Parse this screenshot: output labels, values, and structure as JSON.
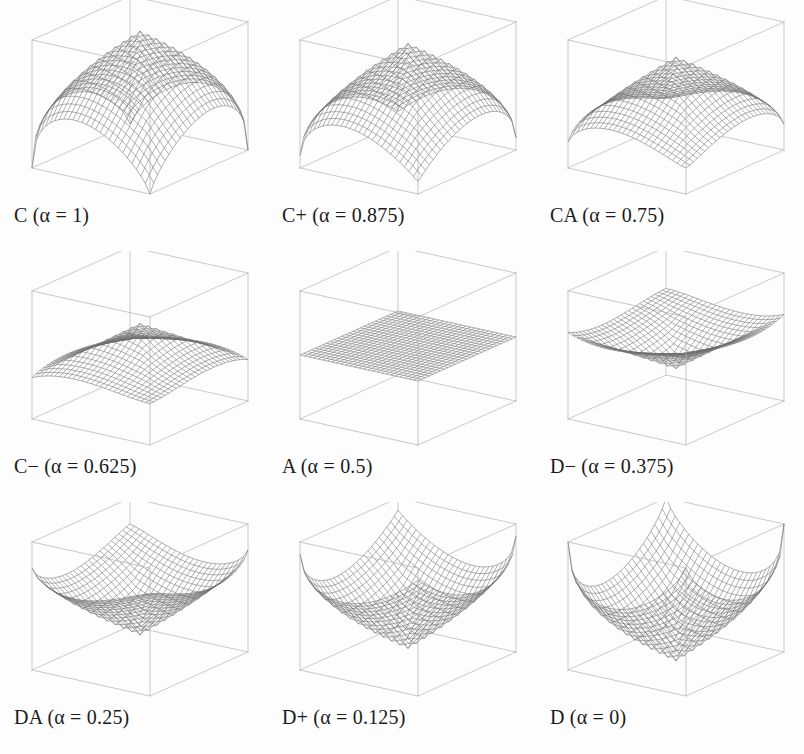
{
  "figure": {
    "title": "",
    "background": "#ffffff",
    "line_color": "#6e6e6e",
    "box_color": "#b0b0b0",
    "rows": 3,
    "cols": 3
  },
  "chart_data": {
    "type": "line",
    "subtype": "3d-wireframe-surface-grid",
    "title": "",
    "xlabel": "",
    "ylabel": "",
    "zlabel": "",
    "grid": false,
    "legend": null,
    "axis_ticks_shown": false,
    "bounding_box": "unit cube wireframe",
    "mesh_resolution": 26,
    "parameter_name": "alpha",
    "panel_layout": [
      [
        "C",
        "C+",
        "CA"
      ],
      [
        "C-",
        "A",
        "D-"
      ],
      [
        "DA",
        "D+",
        "D"
      ]
    ],
    "panels": [
      {
        "id": "C",
        "name": "C",
        "label": "C (α = 1)",
        "alpha": 1,
        "alpha_text": "1",
        "shape": "peak",
        "description": "Conjunction / minimum-like; sharp single peak rising to full height at center-rear, falling to zero along the front edges"
      },
      {
        "id": "C+",
        "name": "C+",
        "label": "C+ (α = 0.875)",
        "alpha": 0.875,
        "alpha_text": "0.875",
        "shape": "peak",
        "description": "Rounded dome, slightly less sharp than C"
      },
      {
        "id": "CA",
        "name": "CA",
        "label": "CA (α = 0.75)",
        "alpha": 0.75,
        "alpha_text": "0.75",
        "shape": "peak",
        "description": "Broad convex dome flattening toward the plane"
      },
      {
        "id": "C-",
        "name": "C−",
        "label": "C− (α = 0.625)",
        "alpha": 0.625,
        "alpha_text": "0.625",
        "shape": "peak",
        "description": "Slightly convex surface approaching the flat plane"
      },
      {
        "id": "A",
        "name": "A",
        "label": "A (α = 0.5)",
        "alpha": 0.5,
        "alpha_text": "0.5",
        "shape": "plane",
        "description": "Arithmetic mean; perfectly flat plane at mid-height"
      },
      {
        "id": "D-",
        "name": "D−",
        "label": "D− (α = 0.375)",
        "alpha": 0.375,
        "alpha_text": "0.375",
        "shape": "valley",
        "description": "Slightly concave saddle dipping below the plane"
      },
      {
        "id": "DA",
        "name": "DA",
        "label": "DA (α = 0.25)",
        "alpha": 0.25,
        "alpha_text": "0.25",
        "shape": "valley",
        "description": "Broad concave bowl descending toward the front corner"
      },
      {
        "id": "D+",
        "name": "D+",
        "label": "D+ (α = 0.125)",
        "alpha": 0.125,
        "alpha_text": "0.125",
        "shape": "valley",
        "description": "Deep funnel converging on the bottom front corner"
      },
      {
        "id": "D",
        "name": "D",
        "label": "D (α = 0)",
        "alpha": 0,
        "alpha_text": "0",
        "shape": "valley",
        "description": "Disjunction / maximum-like; sharp inverted cone reaching zero at the front corner"
      }
    ]
  }
}
